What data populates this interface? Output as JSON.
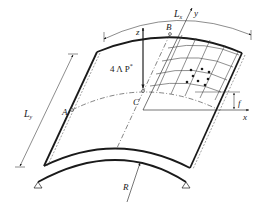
{
  "figure": {
    "labels": {
      "Lx": "L",
      "Lx_sub": "x",
      "y_axis": "y",
      "z_axis": "z",
      "x_axis": "x",
      "B": "B",
      "C": "C",
      "A": "A",
      "Ly": "L",
      "Ly_sub": "y",
      "load": "4 Λ P*",
      "load_main": "4 Λ P",
      "load_sup": "*",
      "f": "f",
      "R": "R"
    },
    "colors": {
      "line": "#1a1a1a",
      "background": "#ffffff"
    }
  }
}
